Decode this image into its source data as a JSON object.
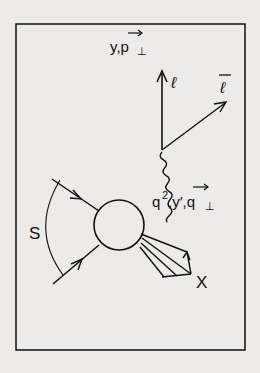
{
  "diagram": {
    "type": "feynman-drell-yan",
    "labels": {
      "top": "y, p⊥",
      "lepton": "ℓ",
      "antilepton": "ℓ̄",
      "photon": "q², y′, q⊥",
      "energy": "S",
      "hadrons": "X"
    },
    "colors": {
      "background": "#ecebe9",
      "ink": "#111111"
    }
  }
}
